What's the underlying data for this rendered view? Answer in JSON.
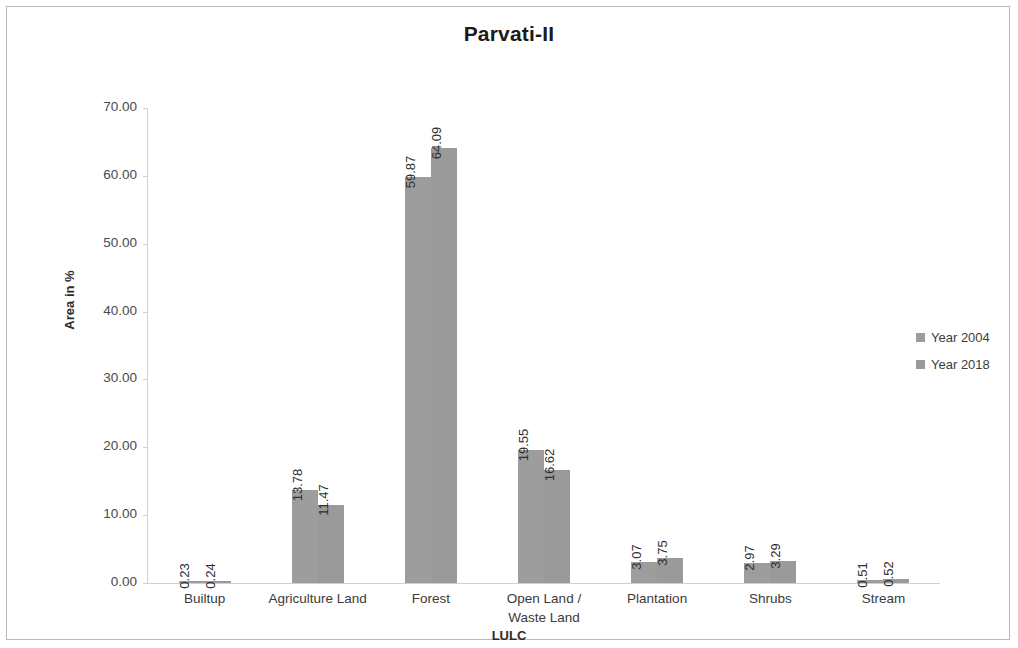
{
  "figure": {
    "title": "Parvati-II",
    "border_color": "#b9b9b9",
    "background": "#ffffff"
  },
  "legend": {
    "position": "right",
    "items": [
      {
        "label": "Year 2004",
        "color": "#9d9d9d"
      },
      {
        "label": "Year 2018",
        "color": "#9a9a9a"
      }
    ]
  },
  "axes": {
    "ylabel": "Area in %",
    "xlabel": "LULC",
    "yticks": [
      "0.00",
      "10.00",
      "20.00",
      "30.00",
      "40.00",
      "50.00",
      "60.00",
      "70.00"
    ]
  },
  "chart_data": {
    "type": "bar",
    "title": "Parvati-II",
    "subtitle": "",
    "xlabel": "LULC",
    "ylabel": "Area in %",
    "ylim": [
      0,
      70
    ],
    "ytick_step": 10,
    "grid": false,
    "legend_position": "right",
    "categories": [
      "Builtup",
      "Agriculture Land",
      "Forest",
      "Open Land / Waste Land",
      "Plantation",
      "Shrubs",
      "Stream"
    ],
    "series": [
      {
        "name": "Year 2004",
        "color": "#9d9d9d",
        "values": [
          0.23,
          13.78,
          59.87,
          19.55,
          3.07,
          2.97,
          0.51
        ],
        "labels": [
          "0.23",
          "13.78",
          "59.87",
          "19.55",
          "3.07",
          "2.97",
          "0.51"
        ]
      },
      {
        "name": "Year 2018",
        "color": "#9a9a9a",
        "values": [
          0.24,
          11.47,
          64.09,
          16.62,
          3.75,
          3.29,
          0.52
        ],
        "labels": [
          "0.24",
          "11.47",
          "64.09",
          "16.62",
          "3.75",
          "3.29",
          "0.52"
        ]
      }
    ],
    "data_labels": true,
    "data_label_rotation": 90
  },
  "category_lines": [
    [
      "Builtup"
    ],
    [
      "Agriculture Land"
    ],
    [
      "Forest"
    ],
    [
      "Open Land /",
      "Waste Land"
    ],
    [
      "Plantation"
    ],
    [
      "Shrubs"
    ],
    [
      "Stream"
    ]
  ]
}
